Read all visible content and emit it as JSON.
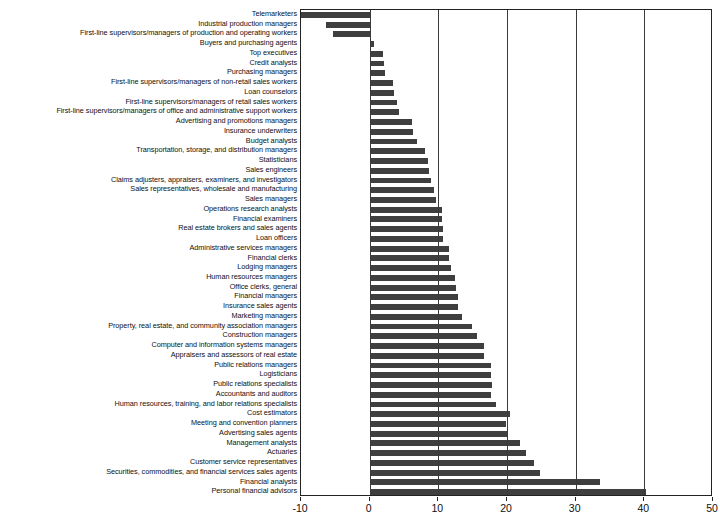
{
  "chart": {
    "type": "bar",
    "orientation": "horizontal",
    "background_color": "#ffffff",
    "bar_color": "#3f3f3f",
    "axis_color": "#222222",
    "grid": "vertical-only"
  },
  "chart_data": {
    "type": "bar",
    "title": "",
    "xlabel": "",
    "ylabel": "",
    "xlim": [
      -10,
      50
    ],
    "ylim": null,
    "grid": true,
    "legend": null,
    "xticks": [
      "-10",
      "0",
      "10",
      "20",
      "30",
      "40",
      "50"
    ],
    "xtick_values": [
      -10,
      0,
      10,
      20,
      30,
      40,
      50
    ],
    "categories": [
      "Telemarketers",
      "Industrial production managers",
      "First-line supervisors/managers of production and operating workers",
      "Buyers and purchasing agents",
      "Top executives",
      "Credit analysts",
      "Purchasing managers",
      "First-line supervisors/managers of non-retail sales workers",
      "Loan counselors",
      "First-line supervisors/managers of retail sales workers",
      "First-line supervisors/managers of office and administrative support workers",
      "Advertising and promotions managers",
      "Insurance underwriters",
      "Budget analysts",
      "Transportation, storage, and distribution managers",
      "Statisticians",
      "Sales engineers",
      "Claims adjusters, appraisers, examiners, and investigators",
      "Sales representatives, wholesale and manufacturing",
      "Sales managers",
      "Operations research analysts",
      "Financial examiners",
      "Real estate brokers and sales agents",
      "Loan officers",
      "Administrative services managers",
      "Financial clerks",
      "Lodging managers",
      "Human resources managers",
      "Office clerks, general",
      "Financial managers",
      "Insurance sales agents",
      "Marketing managers",
      "Property, real estate, and community association managers",
      "Construction managers",
      "Computer and information systems managers",
      "Appraisers and assessors of real estate",
      "Public relations managers",
      "Logisticians",
      "Public relations specialists",
      "Accountants and auditors",
      "Human resources, training, and labor relations specialists",
      "Cost estimators",
      "Meeting and convention planners",
      "Advertising sales agents",
      "Management analysts",
      "Actuaries",
      "Customer service representatives",
      "Securities, commodities, and financial services sales agents",
      "Financial analysts",
      "Personal financial advisors"
    ],
    "values": [
      -10.0,
      -6.4,
      -5.4,
      0.6,
      1.9,
      2.1,
      2.2,
      3.4,
      3.6,
      4.0,
      4.3,
      6.2,
      6.3,
      6.9,
      8.1,
      8.5,
      8.6,
      9.0,
      9.3,
      9.6,
      10.6,
      10.6,
      10.7,
      10.7,
      11.6,
      11.6,
      11.8,
      12.5,
      12.6,
      12.8,
      12.8,
      13.4,
      14.9,
      15.7,
      16.6,
      16.7,
      17.6,
      17.6,
      17.8,
      17.7,
      18.4,
      20.4,
      19.9,
      20.2,
      21.9,
      22.7,
      24.0,
      24.8,
      33.5,
      40.3
    ]
  }
}
